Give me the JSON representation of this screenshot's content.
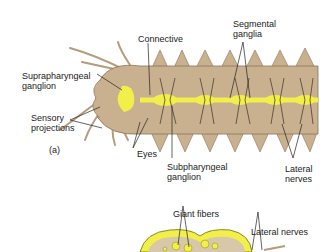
{
  "figure": {
    "panel_a_label": "(a)",
    "labels": {
      "connective": "Connective",
      "segmental_ganglia": "Segmental\nganglia",
      "suprapharyngeal_ganglion": "Suprapharyngeal\nganglion",
      "sensory_projections": "Sensory\nprojections",
      "eyes": "Eyes",
      "subpharyngeal_ganglion": "Subpharyngeal\nganglion",
      "lateral_nerves_a": "Lateral\nnerves",
      "giant_fibers": "Giant fibers",
      "lateral_nerves_b": "Lateral nerves"
    },
    "colors": {
      "body": "#c9b18f",
      "body_outline": "#8a7458",
      "nerve": "#f2ee4a",
      "line": "#222222"
    }
  }
}
